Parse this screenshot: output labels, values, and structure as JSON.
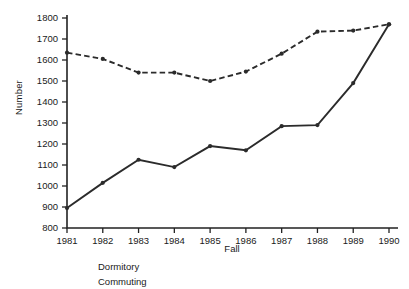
{
  "chart_data": {
    "type": "line",
    "title": "",
    "xlabel": "Fall",
    "ylabel": "Number",
    "categories": [
      "1981",
      "1982",
      "1983",
      "1984",
      "1985",
      "1986",
      "1987",
      "1988",
      "1989",
      "1990"
    ],
    "x": [
      1981,
      1982,
      1983,
      1984,
      1985,
      1986,
      1987,
      1988,
      1989,
      1990
    ],
    "xlim": [
      1981,
      1990
    ],
    "ylim": [
      800,
      1800
    ],
    "yticks": [
      800,
      900,
      1000,
      1100,
      1200,
      1300,
      1400,
      1500,
      1600,
      1700,
      1800
    ],
    "ytick_labels": [
      "800",
      "900",
      "1000",
      "1100",
      "1200",
      "1300",
      "1400",
      "1500",
      "1600",
      "1700",
      "1800"
    ],
    "xtick_labels": [
      "1981",
      "1982",
      "1983",
      "1984",
      "1985",
      "1986",
      "1987",
      "1988",
      "1989",
      "1990"
    ],
    "grid": false,
    "legend_position": "below-axis-left",
    "series": [
      {
        "name": "Dormitory",
        "style": "solid",
        "marker": "dot",
        "values": [
          895,
          1015,
          1125,
          1090,
          1190,
          1170,
          1285,
          1290,
          1490,
          1770
        ]
      },
      {
        "name": "Commuting",
        "style": "dashed",
        "marker": "dot",
        "values": [
          1635,
          1605,
          1540,
          1540,
          1500,
          1545,
          1630,
          1735,
          1740,
          1770
        ]
      }
    ],
    "colors": {
      "line": "#2b2b2b",
      "axis": "#222222",
      "background": "#ffffff"
    }
  },
  "legend": {
    "items": [
      {
        "label": "Dormitory"
      },
      {
        "label": "Commuting"
      }
    ]
  }
}
